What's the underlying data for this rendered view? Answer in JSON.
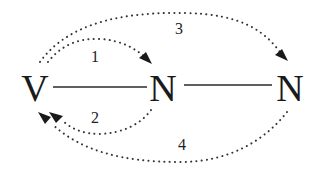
{
  "diagram": {
    "type": "hopping-pathway diagram",
    "nodes": [
      {
        "id": "V",
        "label": "V",
        "x": 35,
        "y": 101
      },
      {
        "id": "N1",
        "label": "N",
        "x": 163,
        "y": 101
      },
      {
        "id": "N2",
        "label": "N",
        "x": 290,
        "y": 101
      }
    ],
    "bonds": [
      {
        "from": "V",
        "to": "N1",
        "style": "solid"
      },
      {
        "from": "N1",
        "to": "N2",
        "style": "solid"
      }
    ],
    "arcs": [
      {
        "id": "1",
        "label": "1",
        "from": "V",
        "to": "N1",
        "side": "above",
        "style": "dotted",
        "arrow": "end"
      },
      {
        "id": "2",
        "label": "2",
        "from": "N1",
        "to": "V",
        "side": "below",
        "style": "dotted",
        "arrow": "end"
      },
      {
        "id": "3",
        "label": "3",
        "from": "V",
        "to": "N2",
        "side": "above",
        "style": "dotted",
        "arrow": "end"
      },
      {
        "id": "4",
        "label": "4",
        "from": "N2",
        "to": "V",
        "side": "below",
        "style": "dotted",
        "arrow": "end"
      }
    ],
    "colors": {
      "ink": "#1a1a1a",
      "background": "#ffffff"
    }
  }
}
